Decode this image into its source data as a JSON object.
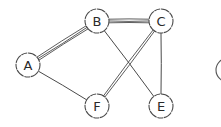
{
  "diagram": {
    "type": "undirected-graph",
    "style": "hand-drawn",
    "colors": {
      "stroke": "#4a4a4a",
      "node_fill": "#ffffff",
      "background": "#ffffff"
    },
    "nodes": [
      {
        "id": "A",
        "label": "A",
        "x": 28,
        "y": 65
      },
      {
        "id": "B",
        "label": "B",
        "x": 97,
        "y": 21
      },
      {
        "id": "C",
        "label": "C",
        "x": 161,
        "y": 21
      },
      {
        "id": "F",
        "label": "F",
        "x": 97,
        "y": 106
      },
      {
        "id": "E",
        "label": "E",
        "x": 161,
        "y": 106
      }
    ],
    "partial_node": {
      "x": 228,
      "y": 70,
      "note": "cut off at right edge"
    },
    "edges": [
      {
        "from": "A",
        "to": "B",
        "multiplicity": 3
      },
      {
        "from": "B",
        "to": "C",
        "multiplicity": 3
      },
      {
        "from": "A",
        "to": "F",
        "multiplicity": 1
      },
      {
        "from": "B",
        "to": "E",
        "multiplicity": 1
      },
      {
        "from": "C",
        "to": "F",
        "multiplicity": 2
      },
      {
        "from": "C",
        "to": "E",
        "multiplicity": 1
      }
    ]
  }
}
